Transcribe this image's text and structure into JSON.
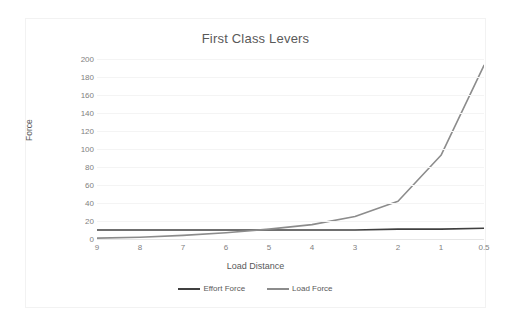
{
  "chart_data": {
    "type": "line",
    "title": "First Class Levers",
    "xlabel": "Load Distance",
    "ylabel": "Force",
    "categories": [
      "9",
      "8",
      "7",
      "6",
      "5",
      "4",
      "3",
      "2",
      "1",
      "0.5"
    ],
    "yticks": [
      "200",
      "180",
      "160",
      "140",
      "120",
      "100",
      "80",
      "60",
      "40",
      "20",
      "0"
    ],
    "ylim": [
      0,
      200
    ],
    "grid": true,
    "legend_position": "bottom",
    "series": [
      {
        "name": "Effort Force",
        "color": "#404040",
        "values": [
          10,
          10,
          10,
          10,
          10,
          10,
          10,
          11,
          11,
          12
        ]
      },
      {
        "name": "Load Force",
        "color": "#8c8c8c",
        "values": [
          1,
          2,
          4,
          7,
          11,
          16,
          25,
          42,
          93,
          193
        ]
      }
    ]
  }
}
